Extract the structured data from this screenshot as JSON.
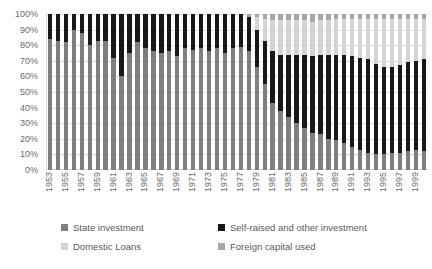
{
  "chart_data": {
    "type": "bar",
    "stacked": true,
    "normalized": true,
    "title": "",
    "subtitle": "",
    "xlabel": "",
    "ylabel": "",
    "ylim": [
      0,
      100
    ],
    "ytick_labels": [
      "0%",
      "10%",
      "20%",
      "30%",
      "40%",
      "50%",
      "60%",
      "70%",
      "80%",
      "90%",
      "100%"
    ],
    "ytick_values": [
      0,
      10,
      20,
      30,
      40,
      50,
      60,
      70,
      80,
      90,
      100
    ],
    "grid": true,
    "legend_position": "bottom",
    "x": [
      1953,
      1954,
      1955,
      1956,
      1957,
      1958,
      1959,
      1960,
      1961,
      1962,
      1963,
      1964,
      1965,
      1966,
      1967,
      1968,
      1969,
      1970,
      1971,
      1972,
      1973,
      1974,
      1975,
      1976,
      1977,
      1978,
      1979,
      1980,
      1981,
      1982,
      1983,
      1984,
      1985,
      1986,
      1987,
      1988,
      1989,
      1990,
      1991,
      1992,
      1993,
      1994,
      1995,
      1996,
      1997,
      1998,
      1999,
      2000
    ],
    "xtick_labels": [
      "1953",
      "1955",
      "1957",
      "1959",
      "1961",
      "1963",
      "1965",
      "1967",
      "1969",
      "1971",
      "1973",
      "1975",
      "1977",
      "1979",
      "1981",
      "1983",
      "1985",
      "1987",
      "1989",
      "1991",
      "1993",
      "1995",
      "1997",
      "1999"
    ],
    "series": [
      {
        "name": "State investment",
        "color": "#7f7f7f",
        "values": [
          84,
          83,
          82,
          90,
          88,
          80,
          83,
          83,
          72,
          60,
          75,
          82,
          78,
          76,
          75,
          76,
          73,
          78,
          77,
          78,
          76,
          78,
          75,
          78,
          79,
          76,
          66,
          55,
          43,
          38,
          34,
          30,
          27,
          24,
          23,
          20,
          19,
          17,
          15,
          13,
          11,
          10,
          10,
          11,
          11,
          12,
          13,
          12
        ]
      },
      {
        "name": "Self-raised and other investment",
        "color": "#181818",
        "values": [
          16,
          17,
          18,
          10,
          12,
          20,
          17,
          17,
          28,
          40,
          25,
          18,
          22,
          24,
          25,
          24,
          27,
          22,
          23,
          22,
          24,
          22,
          25,
          22,
          21,
          22,
          24,
          28,
          33,
          36,
          40,
          44,
          47,
          49,
          51,
          54,
          55,
          57,
          58,
          59,
          60,
          58,
          56,
          55,
          56,
          57,
          57,
          59
        ]
      },
      {
        "name": "Domestic Loans",
        "color": "#d4d4d4",
        "values": [
          0,
          0,
          0,
          0,
          0,
          0,
          0,
          0,
          0,
          0,
          0,
          0,
          0,
          0,
          0,
          0,
          0,
          0,
          0,
          0,
          0,
          0,
          0,
          0,
          0,
          0,
          8,
          14,
          20,
          22,
          22,
          22,
          22,
          22,
          22,
          22,
          23,
          23,
          24,
          25,
          26,
          29,
          31,
          31,
          30,
          28,
          27,
          26
        ]
      },
      {
        "name": "Foreign capital used",
        "color": "#a6a6a6",
        "values": [
          0,
          0,
          0,
          0,
          0,
          0,
          0,
          0,
          0,
          0,
          0,
          0,
          0,
          0,
          0,
          0,
          0,
          0,
          0,
          0,
          0,
          0,
          0,
          0,
          0,
          2,
          2,
          3,
          4,
          4,
          4,
          4,
          4,
          5,
          4,
          4,
          3,
          3,
          3,
          3,
          3,
          3,
          3,
          3,
          3,
          3,
          3,
          3
        ]
      }
    ]
  },
  "legend": {
    "items": [
      {
        "label": "State investment",
        "swatch": "#7f7f7f"
      },
      {
        "label": "Self-raised and other investment",
        "swatch": "#181818"
      },
      {
        "label": "Domestic Loans",
        "swatch": "#d4d4d4"
      },
      {
        "label": "Foreign capital used",
        "swatch": "#a6a6a6"
      }
    ]
  }
}
